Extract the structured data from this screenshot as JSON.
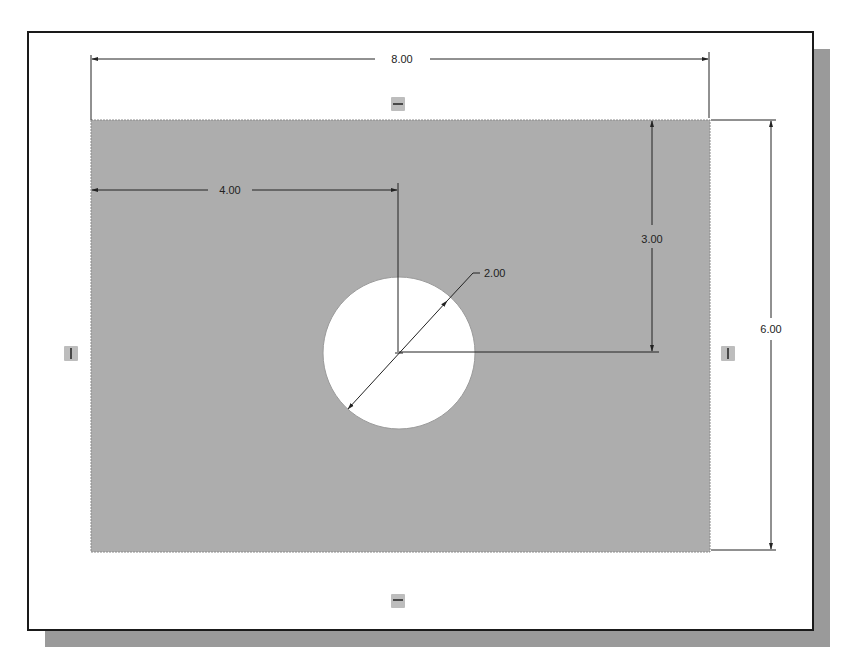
{
  "colors": {
    "sheet_bg": "#ffffff",
    "frame_border": "#1a1a1a",
    "shadow": "#9a9a9a",
    "part_fill": "#adadad",
    "hole_fill": "#ffffff",
    "dimension_line": "#222222",
    "constraint_marker": "#bdbdbd"
  },
  "sketch": {
    "part": {
      "shape": "rectangle",
      "width": "8.00",
      "height": "6.00"
    },
    "hole": {
      "shape": "circle",
      "diameter": "2.00"
    },
    "dimensions": {
      "overall_width": "8.00",
      "overall_height": "6.00",
      "hole_x_offset": "4.00",
      "hole_y_offset": "3.00",
      "hole_diameter": "2.00"
    },
    "constraints": [
      {
        "position": "top",
        "type": "horizontal"
      },
      {
        "position": "bottom",
        "type": "horizontal"
      },
      {
        "position": "left",
        "type": "vertical"
      },
      {
        "position": "right",
        "type": "vertical"
      }
    ]
  }
}
